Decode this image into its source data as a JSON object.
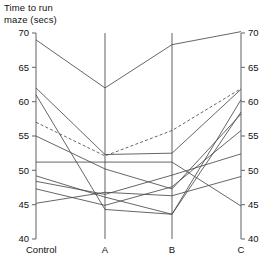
{
  "chart_data": {
    "type": "line",
    "title_line1": "Time to run",
    "title_line2": "maze (secs)",
    "xlabel": "",
    "ylabel": "Time to run maze (secs)",
    "categories": [
      "Control",
      "A",
      "B",
      "C"
    ],
    "ylim": [
      40,
      70
    ],
    "yticks": [
      40,
      45,
      50,
      55,
      60,
      65,
      70
    ],
    "ytick_labels": [
      "40",
      "45",
      "50",
      "55",
      "60",
      "65",
      "70"
    ],
    "right_axis": true,
    "right_yticks": [
      40,
      45,
      50,
      55,
      60,
      65,
      70
    ],
    "right_ytick_labels": [
      "40",
      "45",
      "50",
      "55",
      "60",
      "65",
      "70"
    ],
    "grid": false,
    "legend": "none",
    "series": [
      {
        "name": "subject-1",
        "style": "solid",
        "values": [
          69.0,
          62.0,
          68.3,
          70.2
        ]
      },
      {
        "name": "subject-2",
        "style": "solid",
        "values": [
          62.0,
          52.3,
          52.5,
          61.8
        ]
      },
      {
        "name": "subject-3",
        "style": "solid",
        "values": [
          61.0,
          44.3,
          43.6,
          60.3
        ]
      },
      {
        "name": "subject-4",
        "style": "dashed",
        "values": [
          57.0,
          52.1,
          55.8,
          61.9
        ]
      },
      {
        "name": "subject-5",
        "style": "solid",
        "values": [
          55.0,
          50.2,
          47.3,
          58.2
        ]
      },
      {
        "name": "subject-6",
        "style": "solid",
        "values": [
          51.2,
          51.2,
          51.2,
          44.8
        ]
      },
      {
        "name": "subject-7",
        "style": "solid",
        "values": [
          49.2,
          46.1,
          43.6,
          58.5
        ]
      },
      {
        "name": "subject-8",
        "style": "solid",
        "values": [
          48.4,
          46.5,
          49.3,
          52.4
        ]
      },
      {
        "name": "subject-9",
        "style": "solid",
        "values": [
          47.3,
          44.9,
          47.6,
          55.8
        ]
      },
      {
        "name": "subject-10",
        "style": "solid",
        "values": [
          45.2,
          46.8,
          46.3,
          49.1
        ]
      }
    ]
  }
}
